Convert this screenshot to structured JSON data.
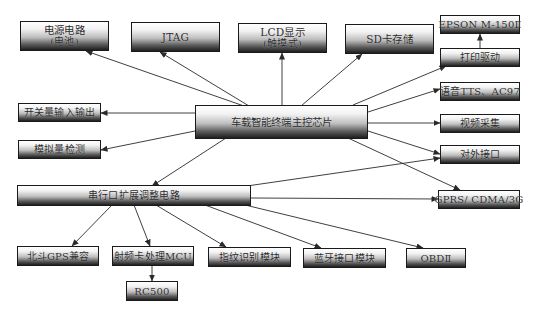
{
  "diagram": {
    "center": {
      "label": "车载智能终端主控芯片"
    },
    "bus": {
      "label": "串行口扩展调整电路"
    },
    "nodes": {
      "power": {
        "label": "电源电路",
        "sub": "(电池)"
      },
      "jtag": {
        "label": "JTAG"
      },
      "lcd": {
        "label": "LCD显示",
        "sub": "(触摸式)"
      },
      "sd": {
        "label": "SD卡存储"
      },
      "printer": {
        "label": "EPSON M-150Ⅱ"
      },
      "print_driver": {
        "label": "打印驱动"
      },
      "switch_io": {
        "label": "开关量输入输出"
      },
      "analog": {
        "label": "模拟量检测"
      },
      "tts": {
        "label": "语音TTS、AC97"
      },
      "video": {
        "label": "视频采集"
      },
      "external": {
        "label": "对外接口"
      },
      "gprs": {
        "label": "GPRS/ CDMA/3G"
      },
      "beidou": {
        "label": "北斗GPS兼容"
      },
      "rfid_mcu": {
        "label": "射频卡处理MCU"
      },
      "rc500": {
        "label": "RC500"
      },
      "fingerprint": {
        "label": "指纹识别模块"
      },
      "bluetooth": {
        "label": "蓝牙接口模块"
      },
      "obd": {
        "label": "OBDⅡ"
      }
    },
    "edges": [
      {
        "from": "center",
        "to": "power"
      },
      {
        "from": "center",
        "to": "jtag"
      },
      {
        "from": "center",
        "to": "lcd"
      },
      {
        "from": "center",
        "to": "sd"
      },
      {
        "from": "center",
        "to": "print_driver"
      },
      {
        "from": "print_driver",
        "to": "printer"
      },
      {
        "from": "center",
        "to": "tts"
      },
      {
        "from": "center",
        "to": "video"
      },
      {
        "from": "center",
        "to": "external"
      },
      {
        "from": "center",
        "to": "gprs"
      },
      {
        "from": "center",
        "to": "switch_io"
      },
      {
        "from": "center",
        "to": "analog"
      },
      {
        "from": "center",
        "to": "bus"
      },
      {
        "from": "bus",
        "to": "external"
      },
      {
        "from": "bus",
        "to": "gprs"
      },
      {
        "from": "bus",
        "to": "beidou"
      },
      {
        "from": "bus",
        "to": "rfid_mcu"
      },
      {
        "from": "rfid_mcu",
        "to": "rc500"
      },
      {
        "from": "bus",
        "to": "fingerprint"
      },
      {
        "from": "bus",
        "to": "bluetooth"
      },
      {
        "from": "bus",
        "to": "obd"
      }
    ],
    "colors": {
      "line": "#2a2a2a",
      "box_border": "#1a1a1a",
      "box_top": "#ffffff",
      "box_bottom": "#1e1e1e",
      "text": "#2b2b2b"
    }
  }
}
